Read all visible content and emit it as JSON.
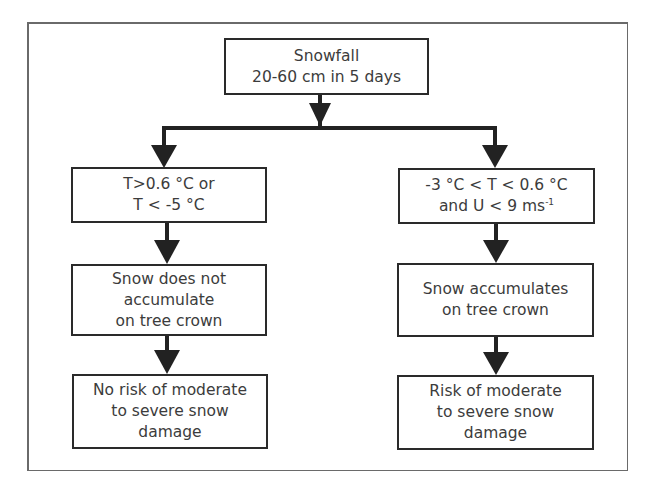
{
  "diagram": {
    "type": "flowchart",
    "colors": {
      "line": "#222222",
      "box_border": "#2a2a2a",
      "text": "#3c3c3c",
      "frame": "#6a6a6a",
      "background": "#ffffff"
    },
    "root": {
      "lines": [
        "Snowfall",
        "20-60 cm in 5 days"
      ]
    },
    "branches": [
      {
        "condition": {
          "lines": [
            "T>0.6 °C or",
            "T < -5 °C"
          ]
        },
        "effect": {
          "lines": [
            "Snow does not",
            "accumulate",
            "on tree crown"
          ]
        },
        "outcome": {
          "lines": [
            "No risk of moderate",
            "to severe snow",
            "damage"
          ]
        }
      },
      {
        "condition": {
          "lines": [
            "-3  °C < T < 0.6 °C",
            "and U < 9 ms"
          ],
          "superscript": "-1"
        },
        "effect": {
          "lines": [
            "Snow accumulates",
            "on tree crown"
          ]
        },
        "outcome": {
          "lines": [
            "Risk of moderate",
            "to severe snow",
            "damage"
          ]
        }
      }
    ],
    "edges": [
      {
        "from": "root",
        "to": "left-condition"
      },
      {
        "from": "root",
        "to": "right-condition"
      },
      {
        "from": "left-condition",
        "to": "left-effect"
      },
      {
        "from": "left-effect",
        "to": "left-outcome"
      },
      {
        "from": "right-condition",
        "to": "right-effect"
      },
      {
        "from": "right-effect",
        "to": "right-outcome"
      }
    ]
  }
}
